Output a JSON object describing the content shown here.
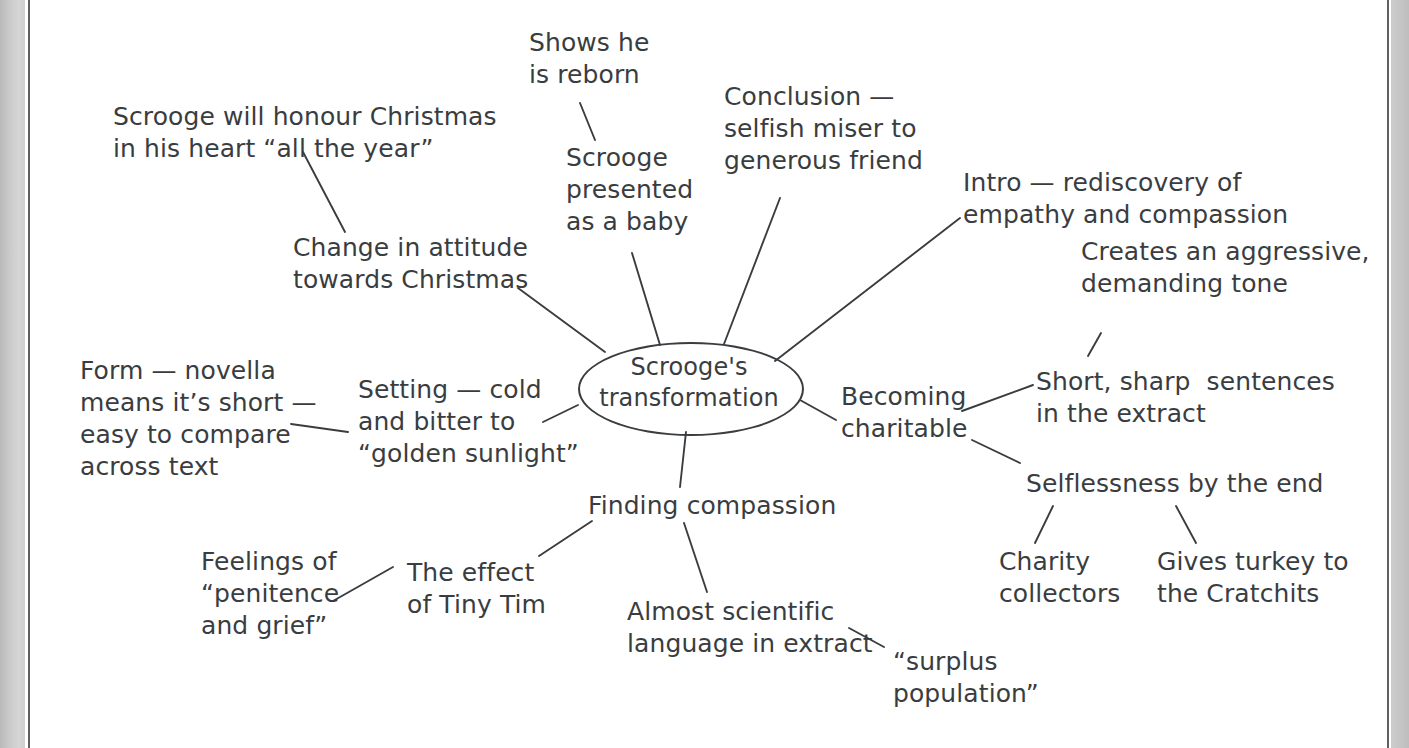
{
  "page": {
    "background_color": "#ffffff",
    "ink_color": "#3a3d40",
    "gutter_color": "#c7c7c7"
  },
  "mindmap": {
    "center": {
      "label": "Scrooge's\ntransformation",
      "line1": "Scrooge's",
      "line2": "transformation"
    },
    "nodes": [
      {
        "id": "change-in-attitude",
        "label": "Change in attitude\ntowards Christmas"
      },
      {
        "id": "scrooge-honour-christmas",
        "label": "Scrooge will honour Christmas\nin his heart “all the year”"
      },
      {
        "id": "scrooge-as-baby",
        "label": "Scrooge\npresented\nas a baby"
      },
      {
        "id": "shows-he-is-reborn",
        "label": "Shows he\nis reborn"
      },
      {
        "id": "conclusion",
        "label": "Conclusion —\nselfish miser to\ngenerous friend"
      },
      {
        "id": "intro",
        "label": "Intro — rediscovery of\nempathy and compassion"
      },
      {
        "id": "becoming-charitable",
        "label": "Becoming\ncharitable"
      },
      {
        "id": "short-sharp-sentences",
        "label": "Short, sharp  sentences\nin the extract"
      },
      {
        "id": "aggressive-tone",
        "label": "Creates an aggressive,\ndemanding tone"
      },
      {
        "id": "selflessness",
        "label": "Selflessness by the end"
      },
      {
        "id": "charity-collectors",
        "label": "Charity\ncollectors"
      },
      {
        "id": "gives-turkey",
        "label": "Gives turkey to\nthe Cratchits"
      },
      {
        "id": "finding-compassion",
        "label": "Finding compassion"
      },
      {
        "id": "scientific-language",
        "label": "Almost scientific\nlanguage in extract"
      },
      {
        "id": "surplus-population",
        "label": "“surplus\npopulation”"
      },
      {
        "id": "effect-of-tiny-tim",
        "label": "The effect\nof Tiny Tim"
      },
      {
        "id": "feelings-of-penitence",
        "label": "Feelings of\n“penitence\nand grief”"
      },
      {
        "id": "setting",
        "label": "Setting — cold\nand bitter to\n“golden sunlight”"
      },
      {
        "id": "form-novella",
        "label": "Form — novella\nmeans it’s short —\neasy to compare\nacross text"
      }
    ],
    "connectors": [
      {
        "from": "center",
        "to": "change-in-attitude",
        "x1": 605,
        "y1": 352,
        "x2": 518,
        "y2": 288
      },
      {
        "from": "change-in-attitude",
        "to": "scrooge-honour-christmas",
        "x1": 345,
        "y1": 232,
        "x2": 303,
        "y2": 152
      },
      {
        "from": "center",
        "to": "scrooge-as-baby",
        "x1": 660,
        "y1": 345,
        "x2": 632,
        "y2": 253
      },
      {
        "from": "scrooge-as-baby",
        "to": "shows-he-is-reborn",
        "x1": 595,
        "y1": 140,
        "x2": 580,
        "y2": 103
      },
      {
        "from": "center",
        "to": "conclusion",
        "x1": 724,
        "y1": 344,
        "x2": 780,
        "y2": 198
      },
      {
        "from": "center",
        "to": "intro",
        "x1": 775,
        "y1": 361,
        "x2": 960,
        "y2": 218
      },
      {
        "from": "center",
        "to": "becoming-charitable",
        "x1": 800,
        "y1": 400,
        "x2": 836,
        "y2": 420
      },
      {
        "from": "becoming-charitable",
        "to": "short-sharp-sentences",
        "x1": 962,
        "y1": 411,
        "x2": 1033,
        "y2": 385
      },
      {
        "from": "short-sharp-sentences",
        "to": "aggressive-tone",
        "x1": 1088,
        "y1": 356,
        "x2": 1101,
        "y2": 333
      },
      {
        "from": "becoming-charitable",
        "to": "selflessness",
        "x1": 972,
        "y1": 440,
        "x2": 1020,
        "y2": 463
      },
      {
        "from": "selflessness",
        "to": "charity-collectors",
        "x1": 1053,
        "y1": 506,
        "x2": 1035,
        "y2": 543
      },
      {
        "from": "selflessness",
        "to": "gives-turkey",
        "x1": 1176,
        "y1": 506,
        "x2": 1196,
        "y2": 543
      },
      {
        "from": "center",
        "to": "finding-compassion",
        "x1": 686,
        "y1": 432,
        "x2": 680,
        "y2": 487
      },
      {
        "from": "finding-compassion",
        "to": "scientific-language",
        "x1": 684,
        "y1": 523,
        "x2": 707,
        "y2": 592
      },
      {
        "from": "scientific-language",
        "to": "surplus-population",
        "x1": 849,
        "y1": 628,
        "x2": 884,
        "y2": 647
      },
      {
        "from": "finding-compassion",
        "to": "effect-of-tiny-tim",
        "x1": 592,
        "y1": 521,
        "x2": 539,
        "y2": 556
      },
      {
        "from": "effect-of-tiny-tim",
        "to": "feelings-of-penitence",
        "x1": 393,
        "y1": 567,
        "x2": 333,
        "y2": 601
      },
      {
        "from": "center",
        "to": "setting",
        "x1": 578,
        "y1": 405,
        "x2": 543,
        "y2": 422
      },
      {
        "from": "setting",
        "to": "form-novella",
        "x1": 348,
        "y1": 432,
        "x2": 291,
        "y2": 424
      }
    ]
  }
}
